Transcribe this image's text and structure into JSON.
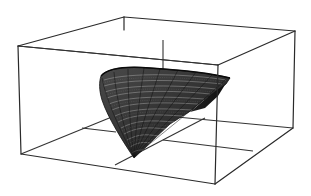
{
  "figure": {
    "type": "3d-surface-plot",
    "colors": {
      "background": "#ffffff",
      "box_edges": "#2a2a2a",
      "surface_fill": "#3a3a3a",
      "surface_dark": "#151515",
      "mesh_lines": "#d8d8d8"
    },
    "box": {
      "back_top_left": [
        124,
        17
      ],
      "back_top_right": [
        295,
        31
      ],
      "front_top_left": [
        18,
        46
      ],
      "front_top_right": [
        218,
        65
      ],
      "front_bottom_left": [
        21,
        154
      ],
      "front_bottom_right": [
        215,
        184
      ],
      "back_bottom_right": [
        293,
        128
      ]
    },
    "axes_labels": [],
    "tick_labels": []
  }
}
